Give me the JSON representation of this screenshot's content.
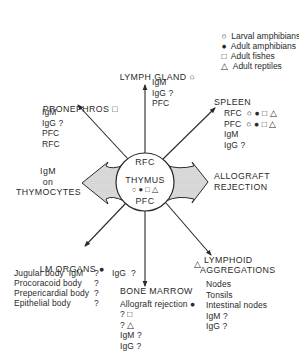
{
  "legend": [
    {
      "symbol": "open-circle",
      "glyph": "○",
      "label": "Larval amphibians"
    },
    {
      "symbol": "filled-circle",
      "glyph": "●",
      "label": "Adult amphibians"
    },
    {
      "symbol": "open-square",
      "glyph": "□",
      "label": "Adult fishes"
    },
    {
      "symbol": "open-triangle",
      "glyph": "△",
      "label": "Adult reptiles"
    }
  ],
  "center": {
    "title": "THYMUS",
    "top_label": "RFC",
    "bottom_label": "PFC",
    "symbols": "○ ● □ △"
  },
  "nodes": {
    "lymph_gland": {
      "title": "LYMPH GLAND",
      "symbol": "○",
      "items": [
        "IgM",
        "IgG ?",
        "PFC"
      ]
    },
    "pronephros": {
      "title": "PRONEPHROS",
      "symbol": "□",
      "items": [
        "IgM",
        "IgG ?",
        "PFC",
        "RFC"
      ]
    },
    "spleen": {
      "title": "SPLEEN",
      "items": [
        {
          "label": "RFC",
          "symbols": "○ ● □ △"
        },
        {
          "label": "PFC",
          "symbols": "○ ● □ △"
        },
        {
          "label": "IgM",
          "symbols": ""
        },
        {
          "label": "IgG ?",
          "symbols": ""
        }
      ]
    },
    "thymocytes": {
      "lines": [
        "IgM",
        "on",
        "THYMOCYTES"
      ]
    },
    "allograft": {
      "lines": [
        "ALLOGRAFT",
        "REJECTION"
      ]
    },
    "lm_organs": {
      "title": "LM ORGANS",
      "symbol": "●",
      "items": [
        {
          "label": "Jugular body  IgM",
          "value": "?"
        },
        {
          "label": "Procoracoid body",
          "value": "?"
        },
        {
          "label": "Prepericardial body",
          "value": "?"
        },
        {
          "label": "Epithelial body",
          "value": "?"
        }
      ]
    },
    "bone_marrow": {
      "side_label": "IgG  ?",
      "title": "BONE MARROW",
      "line1": "Allograft rejection",
      "line1_symbol": "●",
      "items": [
        "? □",
        "? △",
        "IgM ?",
        "IgG ?"
      ]
    },
    "lymphoid": {
      "symbol": "△",
      "title_lines": [
        "LYMPHOID",
        "AGGREGATIONS"
      ],
      "items": [
        "Nodes",
        "Tonsils",
        "Intestinal nodes",
        "IgM ?",
        "IgG ?"
      ]
    }
  }
}
